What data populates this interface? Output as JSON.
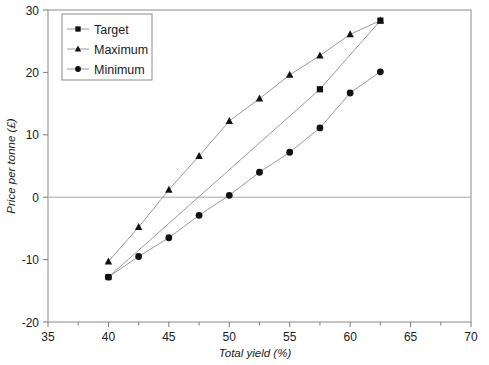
{
  "chart_data": {
    "type": "line",
    "title": "",
    "xlabel": "Total yield (%)",
    "ylabel": "Price per tonne (£)",
    "xlim": [
      35,
      70
    ],
    "ylim": [
      -20,
      30
    ],
    "xticks": [
      35,
      40,
      45,
      50,
      55,
      60,
      65,
      70
    ],
    "xtick_labels": [
      "35",
      "40",
      "45",
      "50",
      "55",
      "60",
      "65",
      "70"
    ],
    "yticks": [
      -20,
      -10,
      0,
      10,
      20,
      30
    ],
    "ytick_labels": [
      "-20",
      "-10",
      "0",
      "10",
      "20",
      "30"
    ],
    "x_minor_step": 2.5,
    "grid": false,
    "zero_line": true,
    "legend_position": "top-left",
    "series": [
      {
        "name": "Target",
        "marker": "square",
        "x": [
          40,
          57.5,
          62.5
        ],
        "y": [
          -12.8,
          17.3,
          28.3
        ]
      },
      {
        "name": "Maximum",
        "marker": "triangle",
        "x": [
          40,
          42.5,
          45,
          47.5,
          50,
          52.5,
          55,
          57.5,
          60,
          62.5
        ],
        "y": [
          -10.3,
          -4.8,
          1.2,
          6.6,
          12.2,
          15.8,
          19.6,
          22.7,
          26.1,
          28.3
        ]
      },
      {
        "name": "Minimum",
        "marker": "circle",
        "x": [
          40,
          42.5,
          45,
          47.5,
          50,
          52.5,
          55,
          57.5,
          60,
          62.5
        ],
        "y": [
          -12.8,
          -9.5,
          -6.5,
          -2.9,
          0.3,
          4.0,
          7.2,
          11.1,
          16.7,
          20.1
        ]
      }
    ]
  },
  "legend": {
    "entries": [
      {
        "label": "Target"
      },
      {
        "label": "Maximum"
      },
      {
        "label": "Minimum"
      }
    ]
  },
  "colors": {
    "marker": "#111111",
    "line": "#9a9a9a",
    "frame": "#8a8a8a",
    "text": "#1a1a1a"
  }
}
